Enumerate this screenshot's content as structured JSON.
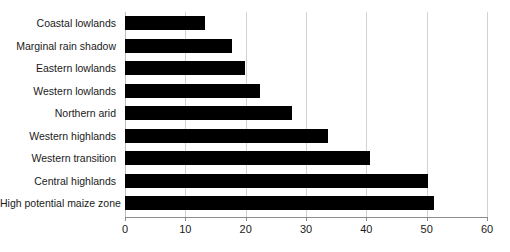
{
  "chart_data": {
    "type": "bar",
    "orientation": "horizontal",
    "title": "",
    "subtitle": "",
    "xlabel": "",
    "ylabel": "",
    "xlim": [
      0,
      60
    ],
    "xticks": [
      0,
      10,
      20,
      30,
      40,
      50,
      60
    ],
    "xtick_labels": [
      "0",
      "10",
      "20",
      "30",
      "40",
      "50",
      "60"
    ],
    "grid": "vertical",
    "legend": null,
    "bar_color": "#000000",
    "gridline_color": "#d2d2d2",
    "axis_color": "#8c8c8c",
    "background": "#ffffff",
    "categories": [
      "Coastal lowlands",
      "Marginal rain shadow",
      "Eastern lowlands",
      "Western lowlands",
      "Northern arid",
      "Western highlands",
      "Western transition",
      "Central highlands",
      "High potential maize zone"
    ],
    "values": [
      13.3,
      17.7,
      19.9,
      22.4,
      27.7,
      33.7,
      40.6,
      50.2,
      51.2
    ]
  }
}
